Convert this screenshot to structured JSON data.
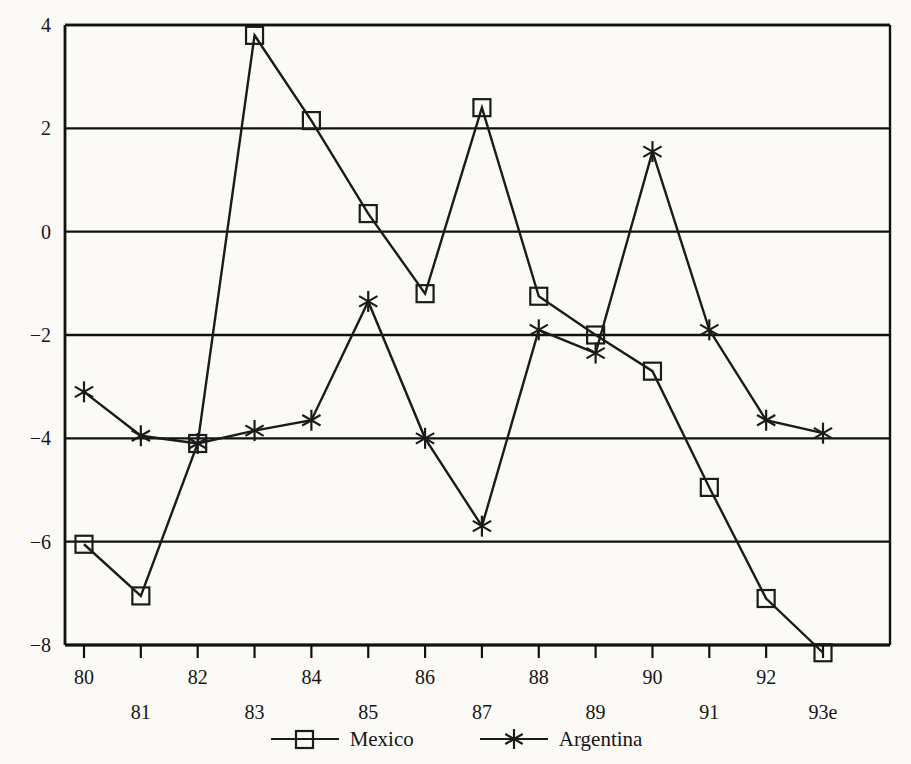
{
  "chart_data": {
    "type": "line",
    "title": "",
    "subtitle": "",
    "xlabel": "",
    "ylabel": "",
    "x": [
      "80",
      "81",
      "82",
      "83",
      "84",
      "85",
      "86",
      "87",
      "88",
      "89",
      "90",
      "91",
      "92",
      "93e"
    ],
    "xtick_labels_top": [
      "80",
      "82",
      "84",
      "86",
      "88",
      "90",
      "92"
    ],
    "xtick_labels_bottom": [
      "81",
      "83",
      "85",
      "87",
      "89",
      "91",
      "93e"
    ],
    "ytick_labels": [
      "4",
      "2",
      "0",
      "−2",
      "−4",
      "−6",
      "−8"
    ],
    "ytick_values": [
      4,
      2,
      0,
      -2,
      -4,
      -6,
      -8
    ],
    "ylim": [
      -8.6,
      4.0
    ],
    "xlim": [
      -0.4,
      13.6
    ],
    "grid": "horizontal",
    "legend_position": "bottom-center",
    "series": [
      {
        "name": "Mexico",
        "marker": "open-square",
        "color": "#1b1b1b",
        "values": [
          -6.05,
          -7.05,
          -4.1,
          3.8,
          2.15,
          0.35,
          -1.2,
          2.4,
          -1.25,
          -2.0,
          -2.7,
          -4.95,
          -7.1,
          -8.15
        ]
      },
      {
        "name": "Argentina",
        "marker": "asterisk",
        "color": "#1b1b1b",
        "values": [
          -3.1,
          -3.95,
          -4.1,
          -3.85,
          -3.65,
          -1.35,
          -4.0,
          -5.7,
          -1.9,
          -2.35,
          1.55,
          -1.9,
          -3.65,
          -3.9
        ]
      }
    ]
  },
  "legend": {
    "entries": [
      {
        "label": "Mexico",
        "marker": "open-square"
      },
      {
        "label": "Argentina",
        "marker": "asterisk"
      }
    ]
  },
  "colors": {
    "ink": "#1b1b1b",
    "axis": "#111111",
    "background": "#fbfaf6"
  }
}
